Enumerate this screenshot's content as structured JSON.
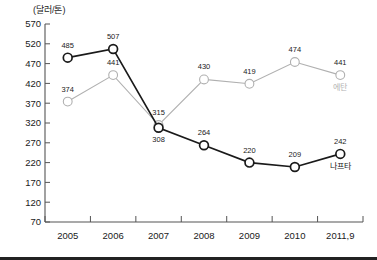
{
  "chart_data": {
    "type": "line",
    "title": "",
    "subtitle": "",
    "ylabel": "(달러/톤)",
    "xlabel": "",
    "categories": [
      "2005",
      "2006",
      "2007",
      "2008",
      "2009",
      "2010",
      "2011,9"
    ],
    "ylim": [
      70,
      570
    ],
    "ytick_step": 50,
    "yticks": [
      "570",
      "520",
      "470",
      "420",
      "370",
      "320",
      "270",
      "220",
      "170",
      "120",
      "70"
    ],
    "grid": false,
    "legend_position": "inline-end-of-line",
    "series": [
      {
        "name": "나프타",
        "color": "#1a1a1a",
        "marker": "open-circle",
        "values": [
          485,
          507,
          308,
          264,
          220,
          209,
          242
        ],
        "labels": [
          "485",
          "507",
          "308",
          "264",
          "220",
          "209",
          "242"
        ],
        "end_label": "나프타"
      },
      {
        "name": "에탄",
        "color": "#b0b0b0",
        "marker": "open-circle",
        "values": [
          374,
          441,
          315,
          430,
          419,
          474,
          441
        ],
        "labels": [
          "374",
          "441",
          "315",
          "430",
          "419",
          "474",
          "441"
        ],
        "end_label": "에탄"
      }
    ]
  },
  "axis": {
    "unit_label": "(달러/톤)"
  },
  "colors": {
    "naphtha": "#1a1a1a",
    "ethane": "#b0b0b0",
    "axis": "#555555",
    "background": "#ffffff"
  }
}
